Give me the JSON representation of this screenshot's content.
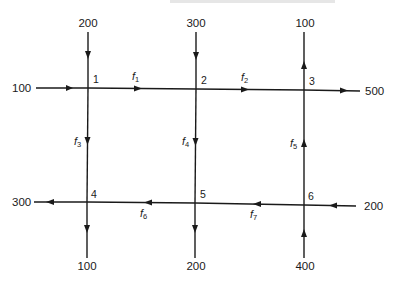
{
  "diagram": {
    "type": "traffic-flow-network",
    "nodes": [
      {
        "id": "1",
        "label": "1",
        "x": 88,
        "y": 88
      },
      {
        "id": "2",
        "label": "2",
        "x": 196,
        "y": 89
      },
      {
        "id": "3",
        "label": "3",
        "x": 304,
        "y": 90
      },
      {
        "id": "4",
        "label": "4",
        "x": 87,
        "y": 202
      },
      {
        "id": "5",
        "label": "5",
        "x": 195,
        "y": 203
      },
      {
        "id": "6",
        "label": "6",
        "x": 304,
        "y": 205
      }
    ],
    "internal_flows": [
      {
        "name": "f",
        "sub": "1",
        "from": "1",
        "to": "2"
      },
      {
        "name": "f",
        "sub": "2",
        "from": "2",
        "to": "3"
      },
      {
        "name": "f",
        "sub": "3",
        "from": "1",
        "to": "4"
      },
      {
        "name": "f",
        "sub": "4",
        "from": "2",
        "to": "5"
      },
      {
        "name": "f",
        "sub": "5",
        "from": "6",
        "to": "3"
      },
      {
        "name": "f",
        "sub": "6",
        "from": "5",
        "to": "4"
      },
      {
        "name": "f",
        "sub": "7",
        "from": "6",
        "to": "5"
      }
    ],
    "external_flows": [
      {
        "node": "1",
        "value": "100",
        "direction": "in",
        "side": "left"
      },
      {
        "node": "1",
        "value": "200",
        "direction": "in",
        "side": "top"
      },
      {
        "node": "2",
        "value": "300",
        "direction": "in",
        "side": "top"
      },
      {
        "node": "3",
        "value": "100",
        "direction": "out",
        "side": "top"
      },
      {
        "node": "3",
        "value": "500",
        "direction": "out",
        "side": "right"
      },
      {
        "node": "4",
        "value": "300",
        "direction": "out",
        "side": "left"
      },
      {
        "node": "4",
        "value": "100",
        "direction": "out",
        "side": "bottom"
      },
      {
        "node": "5",
        "value": "200",
        "direction": "out",
        "side": "bottom"
      },
      {
        "node": "6",
        "value": "200",
        "direction": "in",
        "side": "right"
      },
      {
        "node": "6",
        "value": "400",
        "direction": "in",
        "side": "bottom"
      }
    ]
  },
  "labels": {
    "n1": "1",
    "n2": "2",
    "n3": "3",
    "n4": "4",
    "n5": "5",
    "n6": "6",
    "f_name": "f",
    "f1_sub": "1",
    "f2_sub": "2",
    "f3_sub": "3",
    "f4_sub": "4",
    "f5_sub": "5",
    "f6_sub": "6",
    "f7_sub": "7",
    "in_left_1": "100",
    "in_top_1": "200",
    "in_top_2": "300",
    "out_top_3": "100",
    "out_right_3": "500",
    "out_left_4": "300",
    "out_bottom_4": "100",
    "out_bottom_5": "200",
    "in_right_6": "200",
    "in_bottom_6": "400"
  }
}
